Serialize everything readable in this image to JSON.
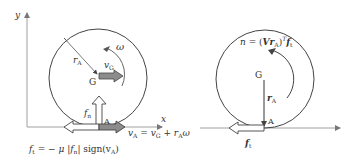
{
  "left_diagram": {
    "axis_y_label": "y",
    "axis_x_label": "x",
    "radius_label": "r",
    "radius_sub": "A",
    "omega_label": "ω",
    "center_label": "G",
    "vG_label": "v",
    "vG_sub": "G",
    "fn_label": "f",
    "fn_sub": "n",
    "contact_label": "A",
    "vA_equation": "v",
    "vA_sub": "A",
    "vA_rhs": " = v",
    "vA_rhs_sub": "G",
    "vA_rhs2": " + r",
    "vA_rhs2_sub": "A",
    "vA_rhs3": "ω",
    "ft_equation_lhs": "f",
    "ft_equation_lhs_sub": "t",
    "ft_equation_rhs": " = − μ |f",
    "ft_equation_rhs_sub": "n",
    "ft_equation_rhs2": "| sign(v",
    "ft_equation_rhs2_sub": "A",
    "ft_equation_rhs3": ")"
  },
  "right_diagram": {
    "torque_lhs": "n",
    "torque_mid": " = (",
    "torque_V": "Vr",
    "torque_V_sub": "A",
    "torque_close": ")",
    "torque_sup": "T",
    "torque_f": "f",
    "torque_f_sub": "t",
    "center_label": "G",
    "rA_label": "r",
    "rA_sub": "A",
    "contact_label": "A",
    "ft_label": "f",
    "ft_sub": "t"
  },
  "colors": {
    "line": "#444444",
    "light_axis": "#9a9a9a",
    "arrow_fill_gray": "#8c8c8c",
    "arrow_outline": "#444444",
    "text": "#333333"
  }
}
